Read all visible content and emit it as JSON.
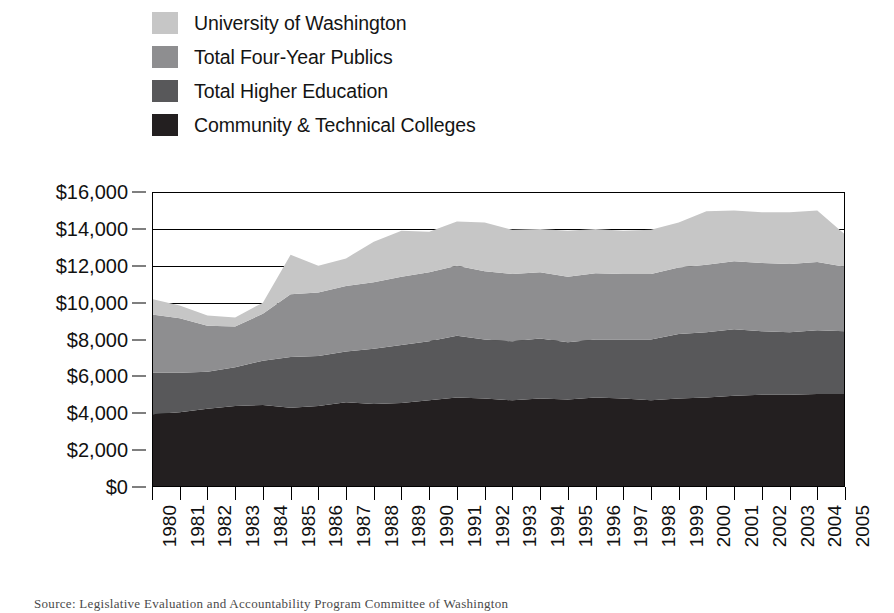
{
  "chart_data": {
    "type": "area",
    "stacked": true,
    "title": "",
    "xlabel": "",
    "ylabel": "",
    "ylim": [
      0,
      16000
    ],
    "ytick_values": [
      0,
      2000,
      4000,
      6000,
      8000,
      10000,
      12000,
      14000,
      16000
    ],
    "ytick_labels": [
      "$0",
      "$2,000",
      "$4,000",
      "$6,000",
      "$8,000",
      "$10,000",
      "$12,000",
      "$14,000",
      "$16,000"
    ],
    "grid": true,
    "legend_position": "above-plot",
    "categories": [
      1980,
      1981,
      1982,
      1983,
      1984,
      1985,
      1986,
      1987,
      1988,
      1989,
      1990,
      1991,
      1992,
      1993,
      1994,
      1995,
      1996,
      1997,
      1998,
      1999,
      2000,
      2001,
      2002,
      2003,
      2004,
      2005
    ],
    "xtick_labels": [
      "1980",
      "1981",
      "1982",
      "1983",
      "1984",
      "1985",
      "1986",
      "1987",
      "1988",
      "1989",
      "1990",
      "1991",
      "1992",
      "1993",
      "1994",
      "1995",
      "1996",
      "1997",
      "1998",
      "1999",
      "2000",
      "2001",
      "2002",
      "2003",
      "2004",
      "2005"
    ],
    "series": [
      {
        "name": "Community & Technical Colleges",
        "color": "#231f20",
        "values": [
          3950,
          4050,
          4250,
          4400,
          4450,
          4300,
          4400,
          4600,
          4500,
          4550,
          4700,
          4850,
          4800,
          4700,
          4800,
          4750,
          4850,
          4800,
          4700,
          4800,
          4850,
          4950,
          5000,
          5000,
          5050,
          5050
        ]
      },
      {
        "name": "Total Higher Education",
        "color": "#58585a",
        "values": [
          2250,
          2150,
          2000,
          2100,
          2400,
          2750,
          2700,
          2750,
          3000,
          3150,
          3200,
          3350,
          3200,
          3200,
          3250,
          3100,
          3150,
          3200,
          3300,
          3500,
          3550,
          3600,
          3450,
          3400,
          3450,
          3400
        ]
      },
      {
        "name": "Total Four-Year Publics",
        "color": "#8e8e90",
        "values": [
          3150,
          2950,
          2500,
          2200,
          2550,
          3400,
          3450,
          3550,
          3600,
          3700,
          3750,
          3800,
          3700,
          3650,
          3600,
          3550,
          3600,
          3550,
          3550,
          3600,
          3650,
          3700,
          3700,
          3700,
          3700,
          3500
        ]
      },
      {
        "name": "University of Washington",
        "color": "#c6c6c6",
        "values": [
          850,
          700,
          550,
          500,
          600,
          2150,
          1450,
          1500,
          2200,
          2500,
          2200,
          2400,
          2650,
          2400,
          2350,
          2500,
          2400,
          2350,
          2400,
          2450,
          2900,
          2750,
          2750,
          2800,
          2800,
          1750
        ]
      }
    ],
    "legend": [
      {
        "label": "University of Washington",
        "color": "#c6c6c6"
      },
      {
        "label": "Total Four-Year Publics",
        "color": "#8e8e90"
      },
      {
        "label": "Total Higher Education",
        "color": "#58585a"
      },
      {
        "label": "Community & Technical Colleges",
        "color": "#231f20"
      }
    ]
  },
  "caption": "Source: Legislative Evaluation and Accountability Program Committee of Washington"
}
